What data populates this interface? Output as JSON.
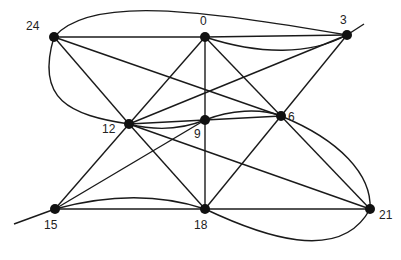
{
  "diagram": {
    "type": "graph",
    "nodes": [
      {
        "id": "24",
        "label": "24",
        "x": 54,
        "y": 37,
        "lx": 26,
        "ly": 30
      },
      {
        "id": "0",
        "label": "0",
        "x": 205,
        "y": 37,
        "lx": 200,
        "ly": 25
      },
      {
        "id": "3",
        "label": "3",
        "x": 347,
        "y": 35,
        "lx": 340,
        "ly": 24
      },
      {
        "id": "12",
        "label": "12",
        "x": 129,
        "y": 124,
        "lx": 102,
        "ly": 133
      },
      {
        "id": "9",
        "label": "9",
        "x": 205,
        "y": 120,
        "lx": 194,
        "ly": 138
      },
      {
        "id": "6",
        "label": "6",
        "x": 281,
        "y": 116,
        "lx": 288,
        "ly": 121
      },
      {
        "id": "15",
        "label": "15",
        "x": 55,
        "y": 209,
        "lx": 44,
        "ly": 229
      },
      {
        "id": "18",
        "label": "18",
        "x": 205,
        "y": 209,
        "lx": 194,
        "ly": 229
      },
      {
        "id": "21",
        "label": "21",
        "x": 370,
        "y": 209,
        "lx": 379,
        "ly": 219
      }
    ],
    "edges": [
      {
        "from": "24",
        "to": "0",
        "kind": "straight"
      },
      {
        "from": "24",
        "to": "3",
        "kind": "curved",
        "path": "M54 37 C 90 -5, 200 10, 347 35"
      },
      {
        "from": "24",
        "to": "12",
        "kind": "straight"
      },
      {
        "from": "24",
        "to": "6",
        "kind": "straight"
      },
      {
        "from": "24",
        "to": "12",
        "kind": "curved",
        "path": "M54 37 C 35 100, 70 115, 129 124"
      },
      {
        "from": "0",
        "to": "3",
        "kind": "straight"
      },
      {
        "from": "0",
        "to": "3",
        "kind": "curved",
        "path": "M205 37 C 260 55, 310 55, 347 35"
      },
      {
        "from": "0",
        "to": "9",
        "kind": "straight"
      },
      {
        "from": "0",
        "to": "12",
        "kind": "straight"
      },
      {
        "from": "0",
        "to": "6",
        "kind": "straight"
      },
      {
        "from": "3",
        "to": "12",
        "kind": "straight"
      },
      {
        "from": "3",
        "to": "6",
        "kind": "straight"
      },
      {
        "from": "3",
        "to": "ext",
        "kind": "extension",
        "path": "M347 35 L 364 24"
      },
      {
        "from": "12",
        "to": "9",
        "kind": "straight"
      },
      {
        "from": "12",
        "to": "9",
        "kind": "curved",
        "path": "M129 124 C 160 132, 185 128, 205 120"
      },
      {
        "from": "12",
        "to": "15",
        "kind": "straight"
      },
      {
        "from": "12",
        "to": "18",
        "kind": "straight"
      },
      {
        "from": "12",
        "to": "21",
        "kind": "straight"
      },
      {
        "from": "9",
        "to": "6",
        "kind": "straight"
      },
      {
        "from": "9",
        "to": "6",
        "kind": "curved",
        "path": "M205 120 C 230 110, 260 108, 281 116"
      },
      {
        "from": "9",
        "to": "15",
        "kind": "straight"
      },
      {
        "from": "9",
        "to": "18",
        "kind": "straight"
      },
      {
        "from": "6",
        "to": "18",
        "kind": "straight"
      },
      {
        "from": "6",
        "to": "21",
        "kind": "straight"
      },
      {
        "from": "6",
        "to": "21",
        "kind": "curved",
        "path": "M281 116 C 340 140, 372 175, 370 209"
      },
      {
        "from": "15",
        "to": "18",
        "kind": "straight"
      },
      {
        "from": "15",
        "to": "18",
        "kind": "curved",
        "path": "M55 209 C 110 194, 160 194, 205 209"
      },
      {
        "from": "15",
        "to": "ext",
        "kind": "extension",
        "path": "M55 209 L 14 224"
      },
      {
        "from": "18",
        "to": "21",
        "kind": "straight"
      },
      {
        "from": "18",
        "to": "21",
        "kind": "curved",
        "path": "M205 209 C 260 235, 340 265, 370 209"
      }
    ]
  }
}
